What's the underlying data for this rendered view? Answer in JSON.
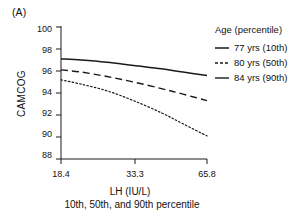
{
  "panel": {
    "label": "(A)"
  },
  "chart_data": {
    "type": "line",
    "title": "",
    "subtitle": "10th, 50th, and 90th percentile",
    "xlabel": "LH (IU/L)",
    "ylabel": "CAMCOG",
    "xticklabels": [
      "18.4",
      "33.3",
      "65.8"
    ],
    "yticklabels": [
      "88",
      "90",
      "92",
      "94",
      "96",
      "98",
      "100"
    ],
    "ylim": [
      88,
      100
    ],
    "xlim": [
      18.4,
      65.8
    ],
    "grid": false,
    "legend_position": "right",
    "legend_title": "Age (percentile)",
    "series": [
      {
        "name": "77 yrs (10th)",
        "style": "solid",
        "x": [
          18.4,
          25.0,
          33.3,
          42.0,
          51.0,
          58.0,
          65.8
        ],
        "values": [
          97.1,
          97.0,
          96.8,
          96.5,
          96.2,
          95.9,
          95.6
        ]
      },
      {
        "name": "80 yrs (50th)",
        "style": "dashed",
        "x": [
          18.4,
          25.0,
          33.3,
          42.0,
          51.0,
          58.0,
          65.8
        ],
        "values": [
          96.1,
          95.9,
          95.5,
          95.0,
          94.4,
          93.9,
          93.3
        ]
      },
      {
        "name": "84 yrs (90th)",
        "style": "dotted",
        "x": [
          18.4,
          25.0,
          33.3,
          42.0,
          51.0,
          58.0,
          65.8
        ],
        "values": [
          95.2,
          94.8,
          94.2,
          93.3,
          92.2,
          91.2,
          90.1
        ]
      }
    ]
  },
  "legend": {
    "title": "Age (percentile)",
    "items": [
      {
        "label": "77 yrs (10th)",
        "style": "solid"
      },
      {
        "label": "80 yrs (50th)",
        "style": "dashed"
      },
      {
        "label": "84 yrs (90th)",
        "style": "dotted"
      }
    ]
  },
  "axes": {
    "y_ticks": [
      {
        "label": "100"
      },
      {
        "label": "98"
      },
      {
        "label": "96"
      },
      {
        "label": "94"
      },
      {
        "label": "92"
      },
      {
        "label": "90"
      },
      {
        "label": "88"
      }
    ],
    "x_ticks": [
      {
        "label": "18.4"
      },
      {
        "label": "33.3"
      },
      {
        "label": "65.8"
      }
    ]
  },
  "colors": {
    "axis": "#1a1a1a",
    "line": "#1a1a1a",
    "background": "#ffffff"
  }
}
